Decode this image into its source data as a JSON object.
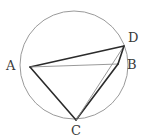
{
  "figure": {
    "canvas": {
      "width": 149,
      "height": 140,
      "background": "#ffffff"
    },
    "circle": {
      "name": "circumscribed-circle",
      "cx": 74,
      "cy": 65,
      "r": 54,
      "stroke": "#9a9a9a",
      "stroke_width": 1,
      "fill": "none"
    },
    "points": [
      {
        "id": "A",
        "label": "A",
        "x": 30,
        "y": 67,
        "label_x": 6,
        "label_y": 59
      },
      {
        "id": "B",
        "label": "B",
        "x": 118,
        "y": 64,
        "label_x": 127,
        "label_y": 58
      },
      {
        "id": "C",
        "label": "C",
        "x": 76,
        "y": 120,
        "label_x": 71,
        "label_y": 124
      },
      {
        "id": "D",
        "label": "D",
        "x": 124,
        "y": 46,
        "label_x": 128,
        "label_y": 31
      }
    ],
    "segments": [
      {
        "id": "AD",
        "from": "A",
        "to": "D",
        "x1": 30,
        "y1": 67,
        "x2": 124,
        "y2": 46,
        "stroke": "#2b2b2b",
        "stroke_width": 1.6
      },
      {
        "id": "AB",
        "from": "A",
        "to": "B",
        "x1": 30,
        "y1": 67,
        "x2": 118,
        "y2": 64,
        "stroke": "#8f8f8f",
        "stroke_width": 0.9
      },
      {
        "id": "AC",
        "from": "A",
        "to": "C",
        "x1": 30,
        "y1": 67,
        "x2": 76,
        "y2": 120,
        "stroke": "#2b2b2b",
        "stroke_width": 1.6
      },
      {
        "id": "CB",
        "from": "C",
        "to": "B",
        "x1": 76,
        "y1": 120,
        "x2": 118,
        "y2": 64,
        "stroke": "#2b2b2b",
        "stroke_width": 1.6
      },
      {
        "id": "CD",
        "from": "C",
        "to": "D",
        "x1": 76,
        "y1": 120,
        "x2": 124,
        "y2": 46,
        "stroke": "#8f8f8f",
        "stroke_width": 0.9
      },
      {
        "id": "BD",
        "from": "B",
        "to": "D",
        "x1": 118,
        "y1": 64,
        "x2": 124,
        "y2": 46,
        "stroke": "#2b2b2b",
        "stroke_width": 1.6
      }
    ],
    "labels": {
      "A": "A",
      "B": "B",
      "C": "C",
      "D": "D"
    },
    "colors": {
      "circle_stroke": "#9a9a9a",
      "chord_dark": "#2b2b2b",
      "chord_light": "#8f8f8f",
      "label_text": "#3a3a3a",
      "background": "#ffffff"
    }
  }
}
